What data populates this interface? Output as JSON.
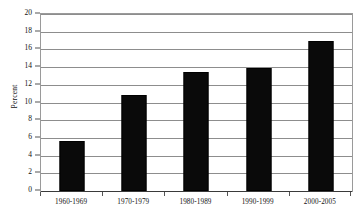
{
  "chart_data": {
    "type": "bar",
    "title": "",
    "subtitle": "",
    "xlabel": "",
    "ylabel": "Percent",
    "categories": [
      "1960-1969",
      "1970-1979",
      "1980-1989",
      "1990-1999",
      "2000-2005"
    ],
    "values": [
      5.7,
      10.8,
      13.5,
      13.9,
      17.0
    ],
    "ylim": [
      0,
      20
    ],
    "ytick_step": 2,
    "ytick_labels": [
      "0",
      "2",
      "4",
      "6",
      "8",
      "10",
      "12",
      "14",
      "16",
      "18",
      "20"
    ],
    "grid": true,
    "grid_axis": "y",
    "legend": false,
    "legend_position": "none",
    "bar_color": "#0a0a0a",
    "grid_color": "#8d8d8d",
    "axis_color": "#9a9a9a",
    "text_color": "#111111",
    "background_color": "#ffffff"
  }
}
